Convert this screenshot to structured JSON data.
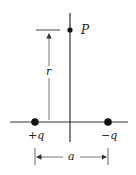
{
  "diagram": {
    "point_label": "P",
    "distance_label": "r",
    "separation_label": "a",
    "charges": [
      {
        "label": "+q",
        "sign": "positive"
      },
      {
        "label": "−q",
        "sign": "negative"
      }
    ],
    "colors": {
      "line": "#333333",
      "dot": "#111111",
      "dimension": "#555555"
    }
  }
}
